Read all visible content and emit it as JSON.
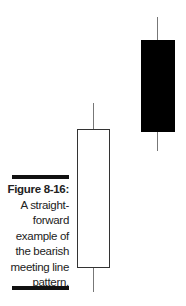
{
  "caption": {
    "label": "Figure 8-16:",
    "text": "A straight-forward example of the bearish meeting line pattern.",
    "lines": [
      "A straight-",
      "forward",
      "example of",
      "the bearish",
      "meeting line",
      "pattern."
    ]
  },
  "candles": [
    {
      "name": "white-candle",
      "color": "#ffffff",
      "type": "bullish"
    },
    {
      "name": "black-candle",
      "color": "#000000",
      "type": "bearish"
    }
  ]
}
